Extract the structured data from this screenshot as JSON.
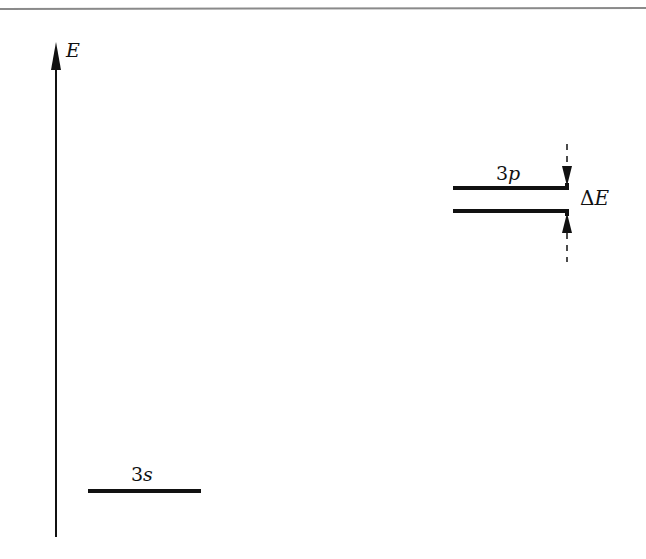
{
  "diagram": {
    "type": "energy-level-diagram",
    "axis": {
      "label": "E",
      "direction": "up"
    },
    "levels": [
      {
        "id": "3s",
        "label_prefix": "3",
        "label_sub": "s",
        "position": "low"
      },
      {
        "id": "3p_upper",
        "label_prefix": "3",
        "label_sub": "p",
        "position": "high",
        "note": "split doublet upper"
      },
      {
        "id": "3p_lower",
        "position": "high",
        "note": "split doublet lower"
      }
    ],
    "splitting": {
      "label_delta": "Δ",
      "label_var": "E"
    }
  },
  "colors": {
    "line": "#111111",
    "rule": "#8a8a8a",
    "background": "#ffffff"
  }
}
